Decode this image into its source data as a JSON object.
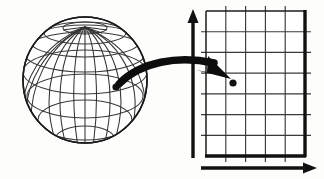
{
  "figure": {
    "title": "Map projection from globe to planar grid",
    "background_color": "#fdfdfc",
    "ink_color": "#141414",
    "line_color": "#2b2b2b",
    "width": 324,
    "height": 179
  },
  "globe": {
    "label": "globe-sphere",
    "center_x": 85,
    "center_y": 80,
    "radius_x": 62,
    "radius_y": 63,
    "outline_color": "#1a1a1a",
    "graticule_color": "#333333",
    "meridian_count": 12,
    "parallel_count": 7,
    "pole_visible": "north",
    "point": {
      "label": "globe-point",
      "x": 116,
      "y": 87,
      "radius": 3.6,
      "color": "#111111"
    }
  },
  "arrow": {
    "label": "projection-arrow",
    "color": "#0d0d0d",
    "start_x": 118,
    "start_y": 84,
    "end_x": 228,
    "end_y": 78,
    "description": "curved arrow from globe point to grid point"
  },
  "grid": {
    "label": "planar-grid",
    "left": 206,
    "top": 11,
    "right": 305,
    "bottom": 156,
    "columns": 5,
    "rows": 7,
    "line_color": "#3a3a3a",
    "border_color": "#111111",
    "border_thick_sides": [
      "bottom",
      "right"
    ],
    "point": {
      "label": "grid-point",
      "x": 233,
      "y": 83,
      "radius": 3.6,
      "color": "#111111"
    }
  },
  "axes": {
    "vertical": {
      "label": "y-axis",
      "x": 193,
      "y_top": 12,
      "y_bottom": 158,
      "color": "#111111",
      "arrow_at": "top"
    },
    "horizontal": {
      "label": "x-axis",
      "y": 168,
      "x_left": 201,
      "x_right": 316,
      "color": "#111111",
      "arrow_at": "right"
    }
  }
}
